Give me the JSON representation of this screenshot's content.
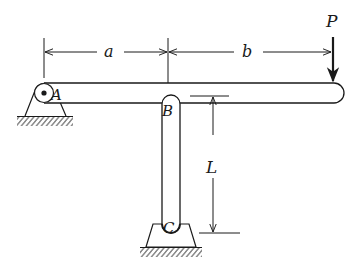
{
  "diagram": {
    "type": "mechanics-beam-link",
    "labels": {
      "pin_a": "A",
      "pin_b": "B",
      "pin_c": "C",
      "dim_a": "a",
      "dim_b": "b",
      "dim_L": "L",
      "load": "P"
    },
    "colors": {
      "ink": "#1a1a1a",
      "background": "#ffffff"
    }
  }
}
